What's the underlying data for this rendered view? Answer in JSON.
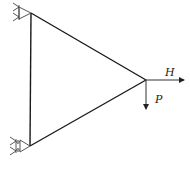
{
  "diagram": {
    "type": "truss",
    "nodes": {
      "top_support": {
        "x": 31,
        "y": 13
      },
      "bottom_support": {
        "x": 30,
        "y": 146
      },
      "load_node": {
        "x": 146,
        "y": 80
      }
    },
    "members": [
      {
        "from": "top_support",
        "to": "bottom_support"
      },
      {
        "from": "top_support",
        "to": "load_node"
      },
      {
        "from": "bottom_support",
        "to": "load_node"
      }
    ],
    "supports": [
      {
        "node": "top_support",
        "type": "pin"
      },
      {
        "node": "bottom_support",
        "type": "roller"
      }
    ],
    "loads": [
      {
        "label": "H",
        "direction": "right",
        "node": "load_node"
      },
      {
        "label": "P",
        "direction": "down",
        "node": "load_node"
      }
    ],
    "colors": {
      "line": "#1a1a1a",
      "load": "#333333",
      "hatch": "#555555"
    }
  },
  "labels": {
    "H": "H",
    "P": "P"
  }
}
